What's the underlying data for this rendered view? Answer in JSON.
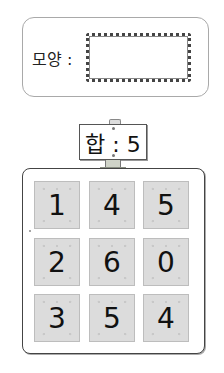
{
  "shape_box": {
    "label": "모양 :"
  },
  "sign": {
    "text": "합 : 5",
    "sum_label": "합",
    "sum_value": 5
  },
  "board": {
    "tiles": [
      {
        "value": "1"
      },
      {
        "value": "4"
      },
      {
        "value": "5"
      },
      {
        "value": "2"
      },
      {
        "value": "6"
      },
      {
        "value": "0"
      },
      {
        "value": "3"
      },
      {
        "value": "5"
      },
      {
        "value": "4"
      }
    ]
  }
}
